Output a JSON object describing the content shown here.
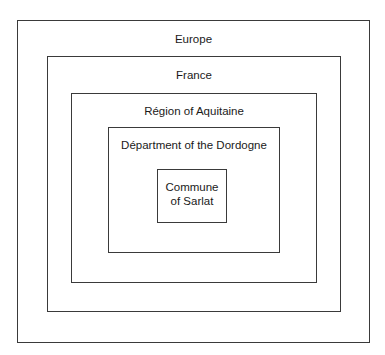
{
  "diagram": {
    "type": "nested-boxes",
    "levels": [
      {
        "label": "Europe"
      },
      {
        "label": "France"
      },
      {
        "label": "Région of Aquitaine"
      },
      {
        "label": "Départment of the Dordogne"
      },
      {
        "label_line1": "Commune",
        "label_line2": "of Sarlat"
      }
    ],
    "border_color": "#3a3a3a",
    "background": "#ffffff"
  }
}
